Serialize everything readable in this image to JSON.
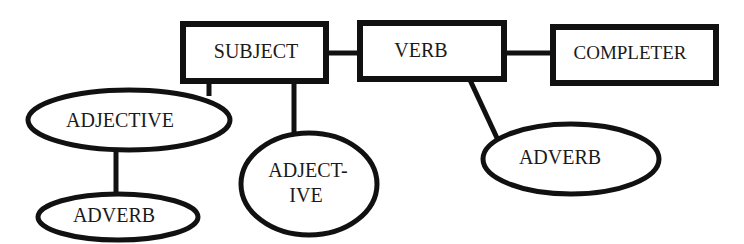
{
  "diagram": {
    "type": "sentence-structure-diagram",
    "nodes": {
      "subject": {
        "label": "SUBJECT",
        "shape": "rectangle"
      },
      "verb": {
        "label": "VERB",
        "shape": "rectangle"
      },
      "completer": {
        "label": "COMPLETER",
        "shape": "rectangle"
      },
      "adjective": {
        "label": "ADJECTIVE",
        "shape": "ellipse"
      },
      "adverb_left": {
        "label": "ADVERB",
        "shape": "ellipse"
      },
      "adjective_split": {
        "line1": "ADJECT-",
        "line2": "IVE",
        "shape": "ellipse"
      },
      "adverb_right": {
        "label": "ADVERB",
        "shape": "ellipse"
      }
    },
    "edges": [
      {
        "from": "SUBJECT",
        "to": "VERB"
      },
      {
        "from": "VERB",
        "to": "COMPLETER"
      },
      {
        "from": "SUBJECT",
        "to": "ADJECTIVE"
      },
      {
        "from": "ADJECTIVE",
        "to": "ADVERB"
      },
      {
        "from": "SUBJECT",
        "to": "ADJECT-IVE"
      },
      {
        "from": "VERB",
        "to": "ADVERB"
      }
    ],
    "colors": {
      "stroke": "#111111",
      "fill": "#ffffff",
      "text": "#1a1a1a"
    }
  }
}
